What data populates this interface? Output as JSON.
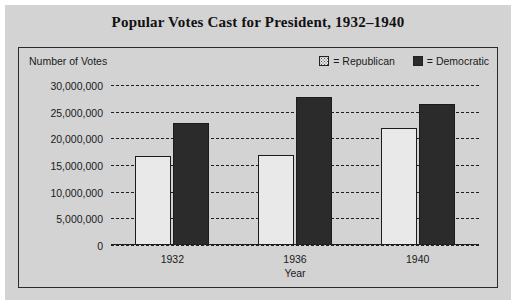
{
  "chart_data": {
    "type": "bar",
    "title": "Popular Votes Cast for President, 1932–1940",
    "xlabel": "Year",
    "ylabel": "Number of Votes",
    "categories": [
      "1932",
      "1936",
      "1940"
    ],
    "series": [
      {
        "name": "Republican",
        "values": [
          16700000,
          16800000,
          22000000
        ],
        "color": "#e9e9e9"
      },
      {
        "name": "Democratic",
        "values": [
          22800000,
          27700000,
          26400000
        ],
        "color": "#2b2b2b"
      }
    ],
    "ylim": [
      0,
      30000000
    ],
    "ytick_values": [
      30000000,
      25000000,
      20000000,
      15000000,
      10000000,
      5000000,
      0
    ],
    "ytick_labels": [
      "30,000,000",
      "25,000,000",
      "20,000,000",
      "15,000,000",
      "10,000,000",
      "5,000,000",
      "0"
    ],
    "grid": true,
    "grid_style": "dashed",
    "legend_position": "top-right",
    "legend_entries": [
      {
        "marker": "republican-swatch",
        "text": "= Republican"
      },
      {
        "marker": "democratic-swatch",
        "text": "= Democratic"
      }
    ]
  },
  "figure": {
    "background": "#d3d3d3",
    "panel_border": "#2a2a2a"
  }
}
